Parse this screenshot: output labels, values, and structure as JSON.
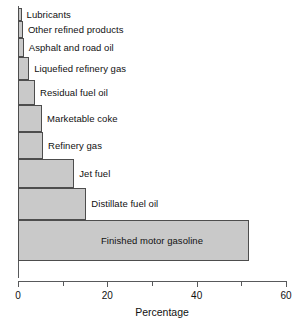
{
  "chart_data": {
    "type": "bar",
    "orientation": "horizontal",
    "title": "",
    "subtitle": "",
    "xlabel": "Percentage",
    "ylabel": "",
    "xlim": [
      0,
      60
    ],
    "xticks": [
      0,
      20,
      40,
      60
    ],
    "xtick_labels": [
      "0",
      "20",
      "40",
      "60"
    ],
    "minor_xticks": [
      10,
      30,
      50
    ],
    "grid": false,
    "legend": null,
    "bar_fill_color": "#c9c9c9",
    "bar_edge_color": "#4d4d4d",
    "axis_color": "#58595b",
    "background_color": "#ffffff",
    "categories": [
      "Lubricants",
      "Other refined products",
      "Asphalt and road oil",
      "Liquefied refinery gas",
      "Residual fuel oil",
      "Marketable coke",
      "Refinery gas",
      "Jet fuel",
      "Distillate fuel oil",
      "Finished motor gasoline"
    ],
    "values": [
      0.8,
      1.1,
      1.3,
      2.5,
      3.8,
      5.4,
      5.6,
      12.6,
      15.3,
      51.7
    ],
    "bar_thickness_px": [
      13,
      17,
      19,
      23,
      25,
      27,
      27,
      29,
      32,
      41
    ],
    "label_placement": [
      "outside",
      "outside",
      "outside",
      "outside",
      "outside",
      "outside",
      "outside",
      "outside",
      "outside",
      "inside"
    ]
  }
}
